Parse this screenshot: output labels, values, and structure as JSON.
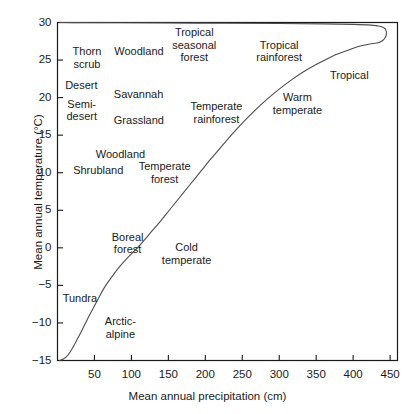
{
  "chart_data": {
    "type": "line",
    "title": "",
    "xlabel": "Mean annual precipitation (cm)",
    "ylabel": "Mean annual temperature (C)",
    "ylabel_display": "Mean annual temperature (°C)",
    "xlim": [
      0,
      460
    ],
    "ylim": [
      -15,
      30
    ],
    "xticks": [
      50,
      100,
      150,
      200,
      250,
      300,
      350,
      400,
      450
    ],
    "xtick_labels": [
      "50",
      "100",
      "150",
      "200",
      "250",
      "300",
      "350",
      "400",
      "450"
    ],
    "yticks": [
      30,
      25,
      20,
      15,
      10,
      5,
      0,
      -5,
      -10,
      -15
    ],
    "ytick_labels": [
      "30",
      "25",
      "20",
      "15",
      "10",
      "5",
      "0",
      "−5",
      "−10",
      "−15"
    ],
    "grid": false,
    "legend": "none",
    "series": [
      {
        "name": "biome boundary curve",
        "points": [
          [
            3,
            -15.0
          ],
          [
            8,
            -14.8
          ],
          [
            14,
            -14.3
          ],
          [
            20,
            -13.4
          ],
          [
            26,
            -12.3
          ],
          [
            33,
            -11.0
          ],
          [
            40,
            -9.6
          ],
          [
            48,
            -8.1
          ],
          [
            56,
            -6.6
          ],
          [
            64,
            -5.2
          ],
          [
            74,
            -3.8
          ],
          [
            84,
            -2.5
          ],
          [
            96,
            -1.2
          ],
          [
            110,
            0.2
          ],
          [
            124,
            1.8
          ],
          [
            138,
            3.4
          ],
          [
            152,
            5.1
          ],
          [
            166,
            6.8
          ],
          [
            180,
            8.5
          ],
          [
            194,
            10.2
          ],
          [
            208,
            11.9
          ],
          [
            222,
            13.5
          ],
          [
            236,
            15.1
          ],
          [
            250,
            16.6
          ],
          [
            264,
            18.0
          ],
          [
            278,
            19.3
          ],
          [
            292,
            20.5
          ],
          [
            306,
            21.6
          ],
          [
            320,
            22.6
          ],
          [
            334,
            23.5
          ],
          [
            348,
            24.3
          ],
          [
            362,
            25.0
          ],
          [
            376,
            25.7
          ],
          [
            390,
            26.2
          ],
          [
            404,
            26.7
          ],
          [
            416,
            27.0
          ],
          [
            426,
            27.2
          ],
          [
            434,
            27.3
          ],
          [
            440,
            27.6
          ],
          [
            444,
            28.1
          ],
          [
            445,
            28.7
          ],
          [
            443,
            29.2
          ],
          [
            436,
            29.5
          ],
          [
            424,
            29.65
          ],
          [
            400,
            29.75
          ],
          [
            360,
            29.82
          ],
          [
            300,
            29.87
          ],
          [
            230,
            29.9
          ],
          [
            150,
            29.93
          ],
          [
            80,
            29.96
          ],
          [
            20,
            29.98
          ],
          [
            3,
            30.0
          ]
        ]
      }
    ],
    "annotations": [
      {
        "text": "Thorn\nscrub",
        "x": 40,
        "y": 25.3,
        "name": "thorn-scrub"
      },
      {
        "text": "Woodland",
        "x": 110,
        "y": 26.2,
        "name": "woodland-upper"
      },
      {
        "text": "Tropical\nseasonal\nforest",
        "x": 185,
        "y": 27.0,
        "name": "tropical-seasonal-forest"
      },
      {
        "text": "Tropical\nrainforest",
        "x": 300,
        "y": 26.2,
        "name": "tropical-rainforest"
      },
      {
        "text": "Tropical",
        "x": 395,
        "y": 23.0,
        "name": "tropical"
      },
      {
        "text": "Desert",
        "x": 32,
        "y": 21.6,
        "name": "desert"
      },
      {
        "text": "Savannah",
        "x": 110,
        "y": 20.4,
        "name": "savannah"
      },
      {
        "text": "Semi-\ndesert",
        "x": 33,
        "y": 18.3,
        "name": "semi-desert"
      },
      {
        "text": "Grassland",
        "x": 110,
        "y": 17.0,
        "name": "grassland"
      },
      {
        "text": "Temperate\nrainforest",
        "x": 215,
        "y": 18.0,
        "name": "temperate-rainforest"
      },
      {
        "text": "Warm\ntemperate",
        "x": 325,
        "y": 19.2,
        "name": "warm-temperate"
      },
      {
        "text": "Woodland",
        "x": 85,
        "y": 12.4,
        "name": "woodland-lower"
      },
      {
        "text": "Shrubland",
        "x": 55,
        "y": 10.3,
        "name": "shrubland"
      },
      {
        "text": "Temperate\nforest",
        "x": 145,
        "y": 10.0,
        "name": "temperate-forest"
      },
      {
        "text": "Boreal\nforest",
        "x": 95,
        "y": 0.6,
        "name": "boreal-forest"
      },
      {
        "text": "Cold\ntemperate",
        "x": 175,
        "y": -0.8,
        "name": "cold-temperate"
      },
      {
        "text": "Tundra",
        "x": 30,
        "y": -6.8,
        "name": "tundra"
      },
      {
        "text": "Arctic-\nalpine",
        "x": 85,
        "y": -10.6,
        "name": "arctic-alpine"
      }
    ],
    "colors": {
      "axis": "#1a1a1a",
      "curve": "#4d4d4d",
      "text": "#1a1a1a",
      "background": "#ffffff"
    }
  }
}
